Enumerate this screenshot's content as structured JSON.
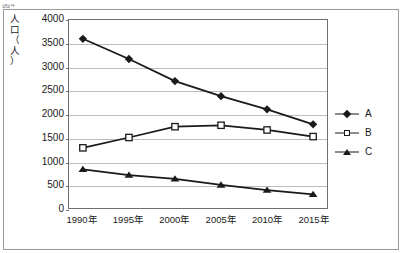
{
  "figure": {
    "caption": "図4",
    "frame_color": "#9a9a9a",
    "plot_border_color": "#6f6f6f",
    "grid_color": "#bdbdbd",
    "ink_color": "#1a1a1a"
  },
  "chart_data": {
    "type": "line",
    "title": "",
    "xlabel": "",
    "ylabel": "人口（人）",
    "ylabel_chars": [
      "人",
      "口",
      "（",
      "人",
      "）"
    ],
    "categories": [
      "1990年",
      "1995年",
      "2000年",
      "2005年",
      "2010年",
      "2015年"
    ],
    "x": [
      1990,
      1995,
      2000,
      2005,
      2010,
      2015
    ],
    "ylim": [
      0,
      4000
    ],
    "ytick_values": [
      0,
      500,
      1000,
      1500,
      2000,
      2500,
      3000,
      3500,
      4000
    ],
    "ytick_labels": [
      "0",
      "500",
      "1000",
      "1500",
      "2000",
      "2500",
      "3000",
      "3500",
      "4000"
    ],
    "grid": true,
    "grid_axis": "y",
    "legend_position": "right",
    "series": [
      {
        "name": "A",
        "marker": "filled-diamond",
        "color": "#1a1a1a",
        "values": [
          3600,
          3170,
          2700,
          2380,
          2100,
          1780
        ]
      },
      {
        "name": "B",
        "marker": "open-square",
        "color": "#1a1a1a",
        "values": [
          1280,
          1500,
          1730,
          1760,
          1660,
          1520
        ]
      },
      {
        "name": "C",
        "marker": "filled-triangle",
        "color": "#1a1a1a",
        "values": [
          820,
          700,
          620,
          490,
          380,
          290
        ]
      }
    ]
  },
  "legend": {
    "entries": [
      {
        "label": "A",
        "marker": "filled-diamond"
      },
      {
        "label": "B",
        "marker": "open-square"
      },
      {
        "label": "C",
        "marker": "filled-triangle"
      }
    ]
  }
}
